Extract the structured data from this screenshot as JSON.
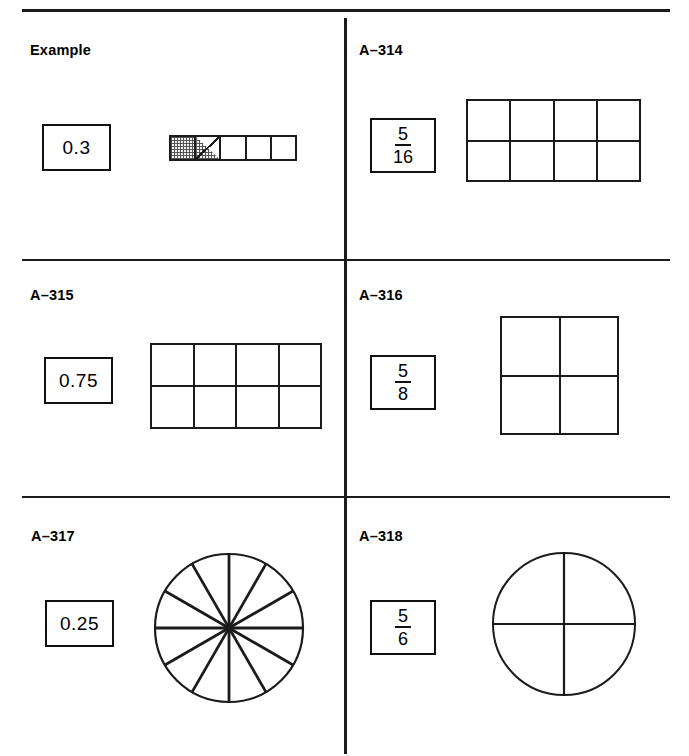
{
  "page": {
    "background": "#ffffff",
    "ink": "#1b1b1b"
  },
  "cells": [
    {
      "id": "example",
      "label": "Example",
      "value": "0.3",
      "value_type": "decimal",
      "figure": "strip-5",
      "figure_description": "A row of 5 equal cells; the first cell fully shaded and the second cell split by a diagonal with the lower-left triangle shaded",
      "shaded_cells": 1,
      "shaded_half_cells": 1,
      "total_cells": 5
    },
    {
      "id": "a314",
      "label": "A–314",
      "value": "5/16",
      "value_type": "fraction",
      "numerator": "5",
      "denominator": "16",
      "figure": "grid-4x2",
      "figure_description": "Rectangle divided into 4 columns and 2 rows (8 equal cells), unshaded",
      "columns": 4,
      "rows": 2,
      "total_cells": 8
    },
    {
      "id": "a315",
      "label": "A–315",
      "value": "0.75",
      "value_type": "decimal",
      "figure": "grid-4x2",
      "figure_description": "Rectangle divided into 4 columns and 2 rows (8 equal cells), unshaded",
      "columns": 4,
      "rows": 2,
      "total_cells": 8
    },
    {
      "id": "a316",
      "label": "A–316",
      "value": "5/8",
      "value_type": "fraction",
      "numerator": "5",
      "denominator": "8",
      "figure": "grid-2x2",
      "figure_description": "Square divided into 2 columns and 2 rows (4 equal cells), unshaded",
      "columns": 2,
      "rows": 2,
      "total_cells": 4
    },
    {
      "id": "a317",
      "label": "A–317",
      "value": "0.25",
      "value_type": "decimal",
      "figure": "circle-12",
      "figure_description": "Circle divided into 12 equal sectors by 6 diameters at 30 degree spacing, unshaded",
      "sectors": 12
    },
    {
      "id": "a318",
      "label": "A–318",
      "value": "5/6",
      "value_type": "fraction",
      "numerator": "5",
      "denominator": "6",
      "figure": "circle-4",
      "figure_description": "Circle divided into 4 equal quadrants by a vertical and a horizontal diameter, unshaded",
      "sectors": 4
    }
  ]
}
